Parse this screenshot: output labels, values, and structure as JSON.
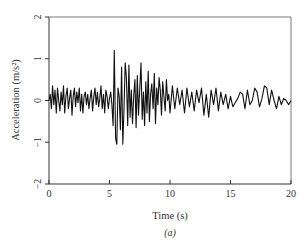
{
  "chart_data": {
    "type": "line",
    "title": "",
    "caption": "(a)",
    "xlabel": "Time (s)",
    "ylabel": "Acceleration (m/s²)",
    "xlim": [
      0,
      20
    ],
    "ylim": [
      -2,
      2
    ],
    "xticks": [
      0,
      5,
      10,
      15,
      20
    ],
    "yticks": [
      -2,
      -1,
      0,
      1,
      2
    ],
    "grid": false,
    "legend": null,
    "series": [
      {
        "name": "acceleration",
        "color": "#111111",
        "x": [
          0,
          0.1,
          0.2,
          0.3,
          0.4,
          0.5,
          0.6,
          0.7,
          0.8,
          0.9,
          1.0,
          1.1,
          1.2,
          1.3,
          1.4,
          1.5,
          1.6,
          1.7,
          1.8,
          1.9,
          2.0,
          2.1,
          2.2,
          2.3,
          2.4,
          2.5,
          2.6,
          2.7,
          2.8,
          2.9,
          3.0,
          3.1,
          3.2,
          3.3,
          3.4,
          3.5,
          3.6,
          3.7,
          3.8,
          3.9,
          4.0,
          4.1,
          4.2,
          4.3,
          4.4,
          4.5,
          4.6,
          4.7,
          4.8,
          4.9,
          5.0,
          5.1,
          5.2,
          5.3,
          5.4,
          5.5,
          5.6,
          5.7,
          5.8,
          5.9,
          6.0,
          6.1,
          6.2,
          6.3,
          6.4,
          6.5,
          6.6,
          6.7,
          6.8,
          6.9,
          7.0,
          7.1,
          7.2,
          7.3,
          7.4,
          7.5,
          7.6,
          7.7,
          7.8,
          7.9,
          8.0,
          8.1,
          8.2,
          8.3,
          8.4,
          8.5,
          8.6,
          8.7,
          8.8,
          8.9,
          9.0,
          9.1,
          9.2,
          9.3,
          9.4,
          9.5,
          9.6,
          9.7,
          9.8,
          9.9,
          10.0,
          10.2,
          10.4,
          10.6,
          10.8,
          11.0,
          11.2,
          11.4,
          11.6,
          11.8,
          12.0,
          12.2,
          12.4,
          12.6,
          12.8,
          13.0,
          13.2,
          13.4,
          13.6,
          13.8,
          14.0,
          14.2,
          14.4,
          14.6,
          14.8,
          15.0,
          15.2,
          15.4,
          15.6,
          15.8,
          16.0,
          16.2,
          16.4,
          16.6,
          16.8,
          17.0,
          17.2,
          17.4,
          17.6,
          17.8,
          18.0,
          18.2,
          18.4,
          18.6,
          18.8,
          19.0,
          19.2,
          19.4,
          19.6,
          19.8,
          20.0
        ],
        "y": [
          0.0,
          0.15,
          -0.2,
          0.35,
          -0.1,
          0.25,
          -0.3,
          0.3,
          0.0,
          -0.25,
          0.2,
          -0.1,
          0.35,
          -0.3,
          0.1,
          0.3,
          -0.2,
          0.05,
          0.25,
          -0.35,
          0.1,
          0.3,
          -0.15,
          0.2,
          -0.05,
          0.3,
          -0.25,
          0.15,
          -0.3,
          0.1,
          0.2,
          -0.1,
          0.15,
          -0.2,
          0.05,
          0.25,
          -0.25,
          0.1,
          0.3,
          -0.1,
          0.2,
          -0.15,
          0.05,
          0.35,
          -0.2,
          0.15,
          -0.3,
          0.25,
          0.1,
          -0.2,
          0.05,
          0.2,
          -0.1,
          -0.6,
          1.2,
          -0.9,
          -1.05,
          0.3,
          0.1,
          -0.7,
          0.8,
          -1.05,
          -0.2,
          0.9,
          0.55,
          -0.6,
          0.85,
          -0.4,
          0.25,
          -0.55,
          0.1,
          0.5,
          -0.65,
          0.6,
          -0.35,
          0.3,
          0.9,
          -0.45,
          0.2,
          -0.6,
          0.45,
          -0.3,
          0.7,
          -0.5,
          0.15,
          0.4,
          -0.2,
          0.65,
          -0.55,
          0.3,
          -0.1,
          0.55,
          0.25,
          -0.35,
          0.45,
          0.1,
          -0.25,
          0.5,
          0.0,
          0.15,
          -0.3,
          0.35,
          -0.2,
          0.3,
          -0.1,
          0.25,
          -0.3,
          0.3,
          -0.15,
          0.2,
          -0.25,
          0.25,
          -0.05,
          0.3,
          -0.35,
          0.15,
          -0.4,
          0.25,
          -0.1,
          0.3,
          -0.25,
          0.2,
          -0.1,
          0.15,
          -0.2,
          0.1,
          -0.15,
          -0.05,
          0.05,
          0.2,
          0.15,
          -0.2,
          0.25,
          -0.1,
          0.0,
          0.3,
          0.2,
          -0.15,
          0.05,
          0.35,
          0.3,
          -0.1,
          0.25,
          0.0,
          -0.2,
          0.1,
          -0.1,
          0.05,
          0.0,
          -0.1,
          0.0
        ]
      }
    ]
  }
}
